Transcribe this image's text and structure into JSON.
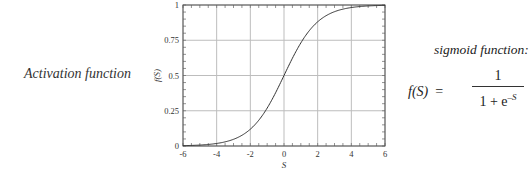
{
  "left_label": "Activation function",
  "formula": {
    "title": "sigmoid function:",
    "lhs": "f(S)",
    "equals": "=",
    "numerator": "1",
    "denominator_base": "1 + e",
    "denominator_exponent": "–S"
  },
  "chart_data": {
    "type": "line",
    "title": "",
    "xlabel": "S",
    "ylabel": "f(S)",
    "xlim": [
      -6,
      6
    ],
    "ylim": [
      0,
      1
    ],
    "grid": true,
    "x_ticks": [
      "-6",
      "-4",
      "-2",
      "0",
      "2",
      "4",
      "6"
    ],
    "y_ticks": [
      "0",
      "0.25",
      "0.5",
      "0.75",
      "1"
    ],
    "series": [
      {
        "name": "sigmoid",
        "x": [
          -6,
          -5,
          -4,
          -3,
          -2,
          -1,
          0,
          1,
          2,
          3,
          4,
          5,
          6
        ],
        "values": [
          0.0025,
          0.0067,
          0.018,
          0.047,
          0.119,
          0.269,
          0.5,
          0.731,
          0.881,
          0.953,
          0.982,
          0.993,
          0.9975
        ]
      }
    ]
  }
}
